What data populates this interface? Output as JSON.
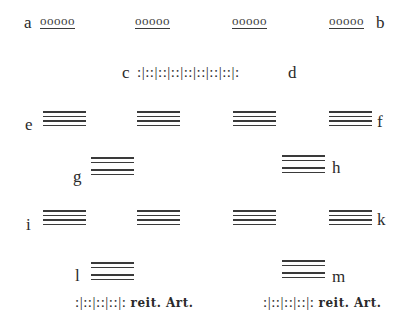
{
  "rows": {
    "row1": {
      "label_left": "a",
      "label_right": "b",
      "groups": [
        "ooooo",
        "ooooo",
        "ooooo",
        "ooooo"
      ]
    },
    "row2": {
      "label_left": "c",
      "label_right": "d",
      "pattern": ":|::|::|::|::|::|::|::|:"
    },
    "row3": {
      "label_left": "e",
      "label_right": "f",
      "stack_count": 4,
      "lines_per_stack": 4
    },
    "row4": {
      "label_left": "g",
      "label_right": "h",
      "stack_count": 2,
      "lines_per_stack": 4,
      "grouping": "2+2"
    },
    "row5": {
      "label_left": "i",
      "label_right": "k",
      "stack_count": 4,
      "lines_per_stack": 4
    },
    "row6": {
      "label_left": "l",
      "label_right": "m",
      "stack_count": 2,
      "lines_per_stack": 4,
      "grouping": "2+2"
    },
    "row7": {
      "left": {
        "pattern": ":|::|::|::|:",
        "annotation": "reit. Art."
      },
      "right": {
        "pattern": ":|::|::|::|:",
        "annotation": "reit. Art."
      }
    }
  },
  "colors": {
    "ink": "#2a2a2a",
    "line": "#3a3a3a",
    "background": "#ffffff"
  }
}
